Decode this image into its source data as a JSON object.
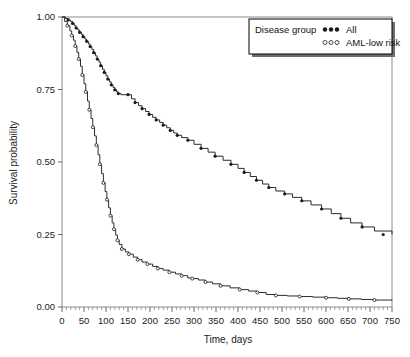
{
  "chart_data": {
    "type": "line",
    "title": "",
    "subtitle": "",
    "xlabel": "Time, days",
    "ylabel": "Survival probability",
    "xlim": [
      0,
      750
    ],
    "ylim": [
      0,
      1
    ],
    "grid": false,
    "legend_position": "top-right",
    "legend_title": "Disease group",
    "xticks": [
      0,
      50,
      100,
      150,
      200,
      250,
      300,
      350,
      400,
      450,
      500,
      550,
      600,
      650,
      700,
      750
    ],
    "xtick_labels": [
      "0",
      "50",
      "100",
      "150",
      "200",
      "250",
      "300",
      "350",
      "400",
      "450",
      "500",
      "550",
      "600",
      "650",
      "700",
      "750"
    ],
    "xminor_step": 10,
    "yticks": [
      0.0,
      0.25,
      0.5,
      0.75,
      1.0
    ],
    "ytick_labels": [
      "0.00",
      "0.25",
      "0.50",
      "0.75",
      "1.00"
    ],
    "series": [
      {
        "name": "All",
        "marker": "filled-circle",
        "color": "#1a1a1a",
        "step": "post",
        "x": [
          0,
          8,
          14,
          19,
          24,
          28,
          32,
          36,
          40,
          44,
          48,
          52,
          56,
          60,
          64,
          68,
          72,
          76,
          80,
          84,
          88,
          92,
          96,
          100,
          104,
          108,
          112,
          116,
          120,
          124,
          128,
          134,
          150,
          158,
          166,
          174,
          182,
          190,
          198,
          206,
          214,
          222,
          230,
          238,
          246,
          254,
          262,
          272,
          286,
          300,
          316,
          332,
          348,
          366,
          384,
          400,
          414,
          428,
          442,
          456,
          470,
          486,
          506,
          524,
          545,
          566,
          590,
          612,
          634,
          656,
          682,
          710,
          750
        ],
        "y": [
          1.0,
          0.995,
          0.99,
          0.985,
          0.978,
          0.97,
          0.962,
          0.955,
          0.947,
          0.94,
          0.932,
          0.924,
          0.916,
          0.907,
          0.898,
          0.888,
          0.877,
          0.866,
          0.855,
          0.844,
          0.832,
          0.82,
          0.809,
          0.797,
          0.786,
          0.776,
          0.766,
          0.757,
          0.749,
          0.742,
          0.736,
          0.732,
          0.732,
          0.718,
          0.705,
          0.694,
          0.684,
          0.674,
          0.664,
          0.654,
          0.645,
          0.636,
          0.627,
          0.618,
          0.609,
          0.6,
          0.592,
          0.584,
          0.575,
          0.561,
          0.547,
          0.534,
          0.52,
          0.506,
          0.492,
          0.478,
          0.464,
          0.45,
          0.437,
          0.424,
          0.412,
          0.4,
          0.39,
          0.378,
          0.366,
          0.352,
          0.338,
          0.322,
          0.306,
          0.29,
          0.276,
          0.262,
          0.25
        ]
      },
      {
        "name": "AML-low risk",
        "marker": "open-circle",
        "color": "#1a1a1a",
        "step": "post",
        "x": [
          0,
          6,
          12,
          18,
          22,
          26,
          30,
          34,
          38,
          42,
          46,
          50,
          54,
          58,
          62,
          66,
          70,
          74,
          78,
          82,
          86,
          90,
          94,
          98,
          102,
          106,
          110,
          114,
          118,
          122,
          126,
          130,
          136,
          144,
          152,
          162,
          172,
          182,
          194,
          206,
          218,
          230,
          244,
          258,
          272,
          286,
          296,
          310,
          326,
          342,
          360,
          382,
          404,
          424,
          444,
          464,
          486,
          512,
          540,
          570,
          600,
          626,
          652,
          680,
          710,
          750
        ],
        "y": [
          1.0,
          0.985,
          0.97,
          0.952,
          0.936,
          0.92,
          0.9,
          0.878,
          0.855,
          0.83,
          0.8,
          0.77,
          0.742,
          0.71,
          0.68,
          0.65,
          0.62,
          0.59,
          0.558,
          0.525,
          0.492,
          0.46,
          0.428,
          0.398,
          0.37,
          0.342,
          0.315,
          0.29,
          0.268,
          0.248,
          0.23,
          0.216,
          0.2,
          0.19,
          0.182,
          0.172,
          0.163,
          0.155,
          0.148,
          0.14,
          0.133,
          0.127,
          0.12,
          0.114,
          0.108,
          0.1,
          0.098,
          0.093,
          0.086,
          0.08,
          0.073,
          0.066,
          0.06,
          0.055,
          0.05,
          0.043,
          0.04,
          0.038,
          0.036,
          0.034,
          0.032,
          0.03,
          0.028,
          0.026,
          0.024,
          0.022
        ]
      }
    ],
    "censored": {
      "All": {
        "x": [
          14,
          24,
          32,
          40,
          48,
          56,
          64,
          72,
          80,
          88,
          96,
          104,
          112,
          120,
          128,
          150,
          166,
          182,
          198,
          214,
          230,
          246,
          262,
          286,
          316,
          348,
          384,
          414,
          442,
          470,
          506,
          545,
          590,
          634,
          682,
          730
        ],
        "y": [
          0.99,
          0.978,
          0.962,
          0.947,
          0.932,
          0.916,
          0.898,
          0.877,
          0.855,
          0.832,
          0.809,
          0.786,
          0.766,
          0.749,
          0.736,
          0.732,
          0.705,
          0.684,
          0.664,
          0.645,
          0.627,
          0.609,
          0.592,
          0.575,
          0.547,
          0.52,
          0.492,
          0.464,
          0.437,
          0.412,
          0.39,
          0.366,
          0.338,
          0.306,
          0.276,
          0.25
        ]
      },
      "AML-low risk": {
        "x": [
          12,
          22,
          30,
          38,
          46,
          54,
          62,
          70,
          78,
          86,
          94,
          102,
          110,
          118,
          126,
          136,
          152,
          172,
          194,
          218,
          244,
          272,
          296,
          326,
          360,
          404,
          444,
          486,
          540,
          600,
          652,
          710
        ],
        "y": [
          0.97,
          0.936,
          0.9,
          0.855,
          0.8,
          0.742,
          0.68,
          0.62,
          0.558,
          0.492,
          0.428,
          0.37,
          0.315,
          0.268,
          0.23,
          0.2,
          0.182,
          0.163,
          0.148,
          0.133,
          0.12,
          0.108,
          0.098,
          0.086,
          0.073,
          0.06,
          0.05,
          0.04,
          0.036,
          0.032,
          0.028,
          0.024
        ]
      }
    }
  },
  "legend": {
    "title": "Disease group",
    "entries": [
      {
        "label": "All",
        "marker": "filled-circle"
      },
      {
        "label": "AML-low risk",
        "marker": "open-circle"
      }
    ]
  },
  "axes": {
    "x_title": "Time, days",
    "y_title": "Survival probability"
  }
}
